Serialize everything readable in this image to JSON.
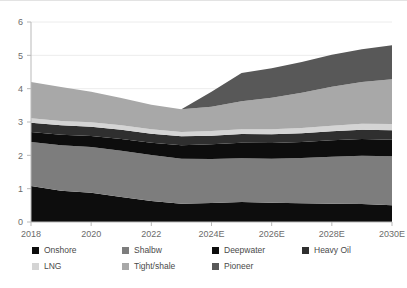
{
  "chart_data": {
    "type": "area",
    "title": "",
    "subtitle": "",
    "xlabel": "",
    "ylabel": "",
    "stacked": true,
    "grid": true,
    "legend_position": "bottom",
    "ylim": [
      0,
      6
    ],
    "yticks": [
      "0",
      "1",
      "2",
      "3",
      "4",
      "5",
      "6"
    ],
    "x": [
      "2018",
      "2019",
      "2020",
      "2021",
      "2022",
      "2023",
      "2024E",
      "2025E",
      "2026E",
      "2027E",
      "2028E",
      "2029E",
      "2030E"
    ],
    "xtick_labels": [
      "2018",
      "2020",
      "2022",
      "2024E",
      "2026E",
      "2028E",
      "2030E"
    ],
    "categories": [
      "2018",
      "2019",
      "2020",
      "2021",
      "2022",
      "2023",
      "2024E",
      "2025E",
      "2026E",
      "2027E",
      "2028E",
      "2029E",
      "2030E"
    ],
    "series": [
      {
        "name": "Onshore",
        "color": "#0d0d0d",
        "values": [
          1.08,
          0.94,
          0.88,
          0.75,
          0.63,
          0.55,
          0.57,
          0.6,
          0.58,
          0.56,
          0.55,
          0.54,
          0.5
        ]
      },
      {
        "name": "Shalbw",
        "color": "#7d7d7d",
        "values": [
          1.32,
          1.36,
          1.37,
          1.39,
          1.38,
          1.35,
          1.32,
          1.31,
          1.32,
          1.36,
          1.41,
          1.45,
          1.47
        ]
      },
      {
        "name": "Deepwater",
        "color": "#0d0d0d",
        "values": [
          0.3,
          0.32,
          0.33,
          0.35,
          0.37,
          0.4,
          0.44,
          0.47,
          0.47,
          0.48,
          0.49,
          0.5,
          0.5
        ]
      },
      {
        "name": "Heavy Oil",
        "color": "#2f2f2f",
        "values": [
          0.28,
          0.28,
          0.28,
          0.28,
          0.27,
          0.27,
          0.26,
          0.26,
          0.26,
          0.26,
          0.27,
          0.28,
          0.28
        ]
      },
      {
        "name": "LNG",
        "color": "#d4d4d4",
        "values": [
          0.13,
          0.13,
          0.13,
          0.13,
          0.13,
          0.13,
          0.14,
          0.14,
          0.15,
          0.16,
          0.17,
          0.18,
          0.19
        ]
      },
      {
        "name": "Tight/shale",
        "color": "#a8a8a8",
        "values": [
          1.09,
          1.02,
          0.92,
          0.82,
          0.74,
          0.68,
          0.73,
          0.84,
          0.95,
          1.06,
          1.17,
          1.25,
          1.34
        ]
      },
      {
        "name": "Pioneer",
        "color": "#585858",
        "values": [
          0.0,
          0.0,
          0.0,
          0.0,
          0.0,
          0.0,
          0.45,
          0.85,
          0.88,
          0.92,
          0.96,
          0.98,
          1.02
        ]
      }
    ],
    "totals": [
      4.2,
      4.05,
      3.91,
      3.72,
      3.52,
      3.38,
      3.91,
      4.47,
      4.61,
      4.8,
      5.02,
      5.18,
      5.3
    ],
    "annotations": []
  },
  "axis": {
    "y_axis_name": "y-axis",
    "x_axis_name": "x-axis"
  },
  "legend": {
    "row1": [
      {
        "label": "Onshore",
        "color": "#0d0d0d"
      },
      {
        "label": "Shalbw",
        "color": "#7d7d7d"
      },
      {
        "label": "Deepwater",
        "color": "#0d0d0d"
      },
      {
        "label": "Heavy Oil",
        "color": "#2f2f2f"
      }
    ],
    "row2": [
      {
        "label": "LNG",
        "color": "#d4d4d4"
      },
      {
        "label": "Tight/shale",
        "color": "#a8a8a8"
      },
      {
        "label": "Pioneer",
        "color": "#585858"
      }
    ]
  }
}
